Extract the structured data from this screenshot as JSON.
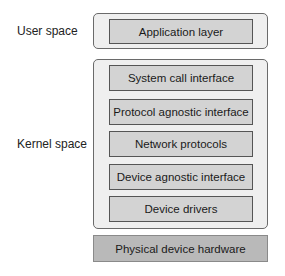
{
  "diagram": {
    "user_space": {
      "label": "User space",
      "layers": [
        "Application layer"
      ]
    },
    "kernel_space": {
      "label": "Kernel space",
      "layers": [
        "System call interface",
        "Protocol agnostic interface",
        "Network protocols",
        "Device agnostic interface",
        "Device drivers"
      ]
    },
    "hardware": {
      "label": "Physical device hardware"
    },
    "colors": {
      "outer_fill": "#efefef",
      "inner_fill": "#d3d3d3",
      "hardware_fill": "#b9b9b9",
      "border": "#555555"
    }
  }
}
